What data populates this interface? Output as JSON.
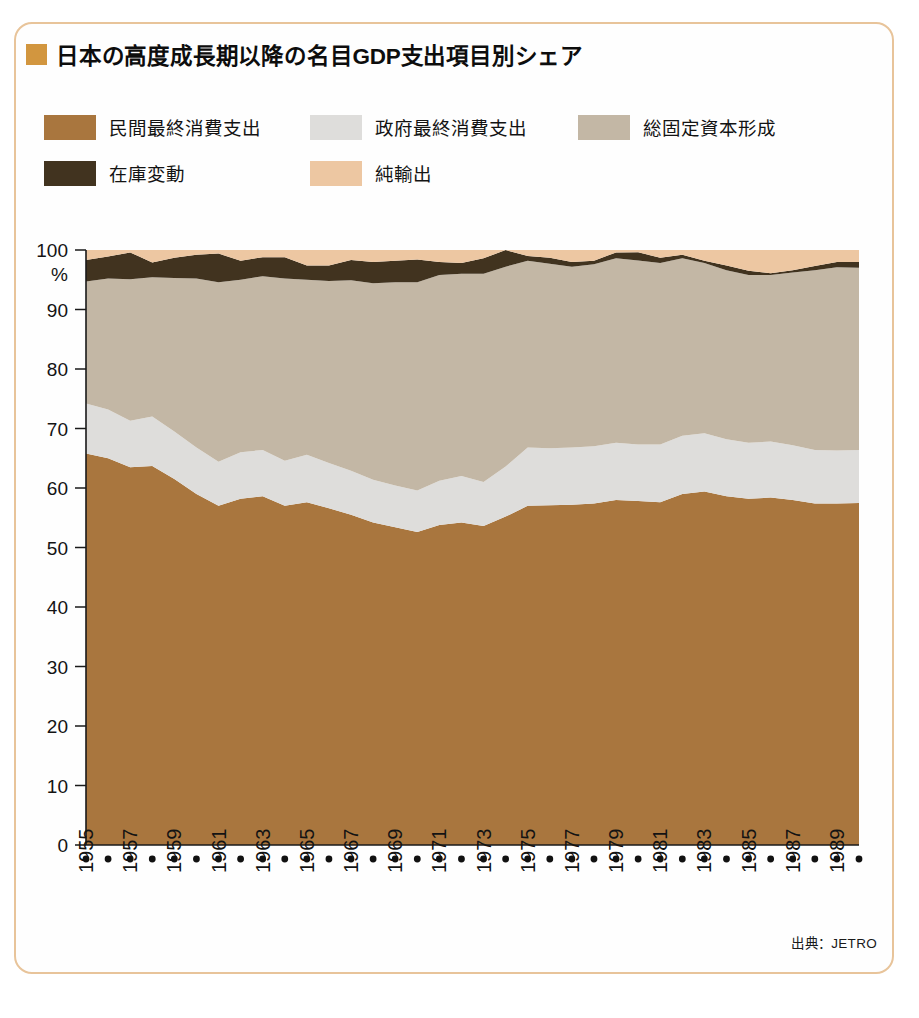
{
  "frame": {
    "border_color": "#e8c49a"
  },
  "title": {
    "bullet_color": "#d2963f",
    "text": "日本の高度成長期以降の名目GDP支出項目別シェア"
  },
  "legend": {
    "items": [
      {
        "label": "民間最終消費支出",
        "color": "#a9763e"
      },
      {
        "label": "政府最終消費支出",
        "color": "#dedddb"
      },
      {
        "label": "総固定資本形成",
        "color": "#c3b7a5"
      },
      {
        "label": "在庫変動",
        "color": "#41331f"
      },
      {
        "label": "純輸出",
        "color": "#edc7a2"
      }
    ]
  },
  "source": {
    "text": "出典：JETRO"
  },
  "chart_data": {
    "type": "area",
    "stacked": true,
    "title": "日本の高度成長期以降の名目GDP支出項目別シェア",
    "xlabel": "",
    "ylabel": "%",
    "ylim": [
      0,
      100
    ],
    "yticks": [
      0,
      10,
      20,
      30,
      40,
      50,
      60,
      70,
      80,
      90,
      100
    ],
    "ytick_labels": [
      "0",
      "10",
      "20",
      "30",
      "40",
      "50",
      "60",
      "70",
      "80",
      "90",
      "100"
    ],
    "y_unit_label": "%",
    "grid": false,
    "legend_position": "top",
    "x": [
      1955,
      1956,
      1957,
      1958,
      1959,
      1960,
      1961,
      1962,
      1963,
      1964,
      1965,
      1966,
      1967,
      1968,
      1969,
      1970,
      1971,
      1972,
      1973,
      1974,
      1975,
      1976,
      1977,
      1978,
      1979,
      1980,
      1981,
      1982,
      1983,
      1984,
      1985,
      1986,
      1987,
      1988,
      1989,
      1990
    ],
    "xtick_labels": [
      "1955",
      "1957",
      "1959",
      "1961",
      "1963",
      "1965",
      "1967",
      "1969",
      "1971",
      "1973",
      "1975",
      "1977",
      "1979",
      "1981",
      "1983",
      "1985",
      "1987",
      "1989"
    ],
    "xtick_label_rotation": -90,
    "xtick_interval_years": 2,
    "xtick_dot_interval_years": 1,
    "series": [
      {
        "name": "民間最終消費支出",
        "color": "#a9763e",
        "values": [
          65.8,
          65.0,
          63.5,
          63.7,
          61.5,
          59.0,
          57.0,
          58.2,
          58.6,
          57.0,
          57.6,
          56.6,
          55.5,
          54.2,
          53.4,
          52.6,
          53.8,
          54.2,
          53.6,
          55.2,
          57.0,
          57.1,
          57.2,
          57.4,
          58.0,
          58.4,
          58.2,
          59.0,
          59.4,
          58.6,
          58.2,
          58.4,
          58.0,
          57.4,
          57.4,
          57.5
        ]
      },
      {
        "name": "政府最終消費支出",
        "color": "#dedddb",
        "values": [
          8.4,
          8.2,
          7.8,
          8.3,
          8.0,
          7.8,
          7.4,
          7.8,
          7.8,
          7.6,
          8.0,
          7.6,
          7.4,
          7.2,
          7.0,
          7.0,
          7.4,
          7.8,
          7.4,
          8.4,
          9.8,
          9.6,
          9.6,
          9.6,
          9.6,
          9.6,
          9.8,
          9.8,
          9.8,
          9.6,
          9.4,
          9.4,
          9.2,
          9.0,
          8.9,
          8.9
        ]
      },
      {
        "name": "総固定資本形成",
        "color": "#c3b7a5",
        "values": [
          20.5,
          22.0,
          23.8,
          23.4,
          25.8,
          28.4,
          30.2,
          29.0,
          29.2,
          30.6,
          29.4,
          30.6,
          32.0,
          33.0,
          34.2,
          35.0,
          34.6,
          34.0,
          35.0,
          33.6,
          31.4,
          31.0,
          30.4,
          30.6,
          31.0,
          31.2,
          30.8,
          29.8,
          28.6,
          28.4,
          28.2,
          28.0,
          29.0,
          30.2,
          30.8,
          30.6
        ]
      },
      {
        "name": "在庫変動",
        "color": "#41331f",
        "values": [
          3.6,
          3.7,
          4.5,
          2.5,
          3.4,
          4.0,
          4.8,
          3.2,
          3.2,
          3.6,
          2.4,
          2.6,
          3.4,
          3.6,
          3.6,
          3.8,
          2.2,
          1.8,
          2.6,
          2.8,
          0.8,
          1.0,
          0.8,
          0.6,
          1.0,
          1.4,
          0.9,
          0.6,
          0.4,
          0.8,
          0.7,
          0.3,
          0.4,
          0.7,
          0.9,
          1.0
        ]
      },
      {
        "name": "純輸出",
        "color": "#edc7a2",
        "values": [
          1.7,
          1.1,
          0.4,
          2.1,
          1.3,
          0.8,
          0.6,
          1.8,
          1.2,
          1.2,
          2.6,
          2.6,
          1.7,
          2.0,
          1.8,
          1.6,
          2.0,
          2.2,
          1.4,
          0.0,
          1.0,
          1.3,
          2.0,
          1.8,
          0.4,
          0.4,
          1.3,
          0.8,
          1.8,
          2.6,
          3.5,
          3.9,
          3.4,
          2.7,
          2.0,
          2.0
        ]
      }
    ]
  }
}
